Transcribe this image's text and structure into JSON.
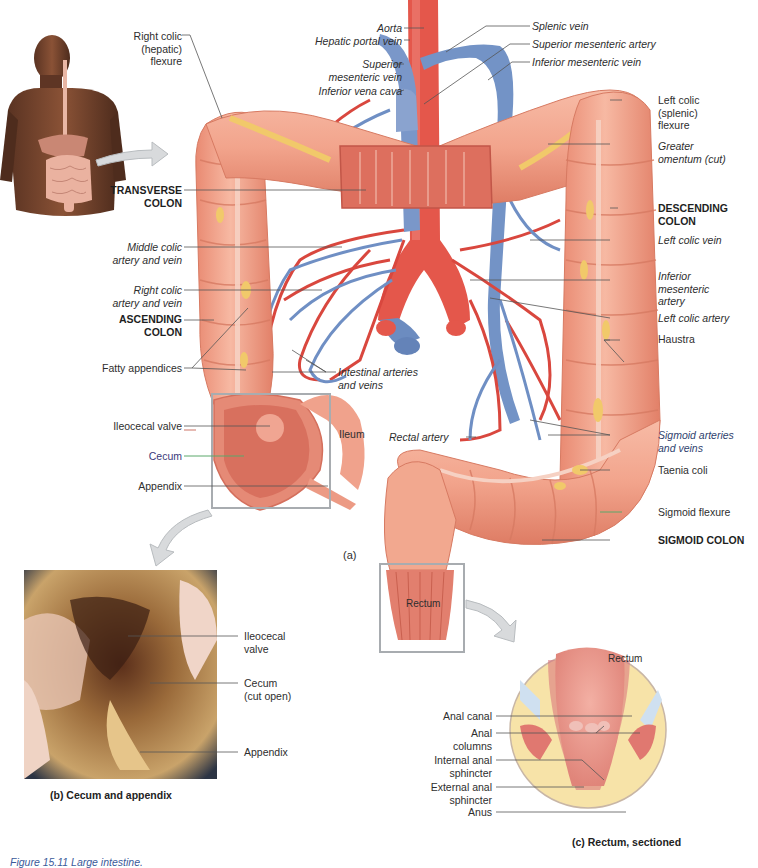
{
  "figure": {
    "caption": "Figure 15.11 Large intestine.",
    "panel_a_tag": "(a)",
    "panel_b_caption": "(b) Cecum and appendix",
    "panel_c_caption": "(c) Rectum, sectioned"
  },
  "colors": {
    "colon": "#f2a88f",
    "colon_dark": "#d9765f",
    "artery": "#d9473e",
    "vein": "#6f8fc4",
    "fat": "#f1c96a",
    "label_line": "#555555",
    "leader_green": "#5aa86a",
    "leader_blue": "#7a8fd0",
    "caption_blue": "#3a5a9a"
  },
  "panel_a": {
    "left_labels": {
      "right_colic_flexure": "Right colic\n(hepatic) flexure",
      "transverse_colon": "TRANSVERSE\nCOLON",
      "middle_colic": "Middle colic\nartery and vein",
      "right_colic_av": "Right colic\nartery and vein",
      "ascending_colon": "ASCENDING\nCOLON",
      "fatty_appendices": "Fatty appendices",
      "ileocecal_valve": "Ileocecal valve",
      "cecum": "Cecum",
      "appendix": "Appendix"
    },
    "top_labels": {
      "aorta": "Aorta",
      "hepatic_portal_vein": "Hepatic portal vein",
      "superior_mesenteric_vein": "Superior\nmesenteric vein",
      "inferior_vena_cava": "Inferior vena cava",
      "splenic_vein": "Splenic vein",
      "superior_mesenteric_artery": "Superior mesenteric artery",
      "inferior_mesenteric_vein": "Inferior mesenteric vein"
    },
    "right_labels": {
      "left_colic_flexure": "Left colic\n(splenic)\nflexure",
      "greater_omentum": "Greater\nomentum (cut)",
      "descending_colon": "DESCENDING\nCOLON",
      "left_colic_vein": "Left colic vein",
      "inferior_mesenteric_artery": "Inferior\nmesenteric\nartery",
      "left_colic_artery": "Left colic artery",
      "haustra": "Haustra",
      "sigmoid_av": "Sigmoid arteries\nand veins",
      "taenia_coli": "Taenia coli",
      "sigmoid_flexure": "Sigmoid flexure",
      "sigmoid_colon": "SIGMOID COLON"
    },
    "center_labels": {
      "intestinal_av": "Intestinal arteries\nand veins",
      "ileum": "Ileum",
      "rectal_artery": "Rectal artery",
      "rectum": "Rectum"
    }
  },
  "panel_b": {
    "labels": {
      "ileocecal_valve": "Ileocecal\nvalve",
      "cecum": "Cecum\n(cut open)",
      "appendix": "Appendix"
    }
  },
  "panel_c": {
    "labels": {
      "rectum": "Rectum",
      "anal_canal": "Anal canal",
      "anal_columns": "Anal\ncolumns",
      "internal_sphincter": "Internal anal\nsphincter",
      "external_sphincter": "External anal\nsphincter",
      "anus": "Anus"
    }
  }
}
